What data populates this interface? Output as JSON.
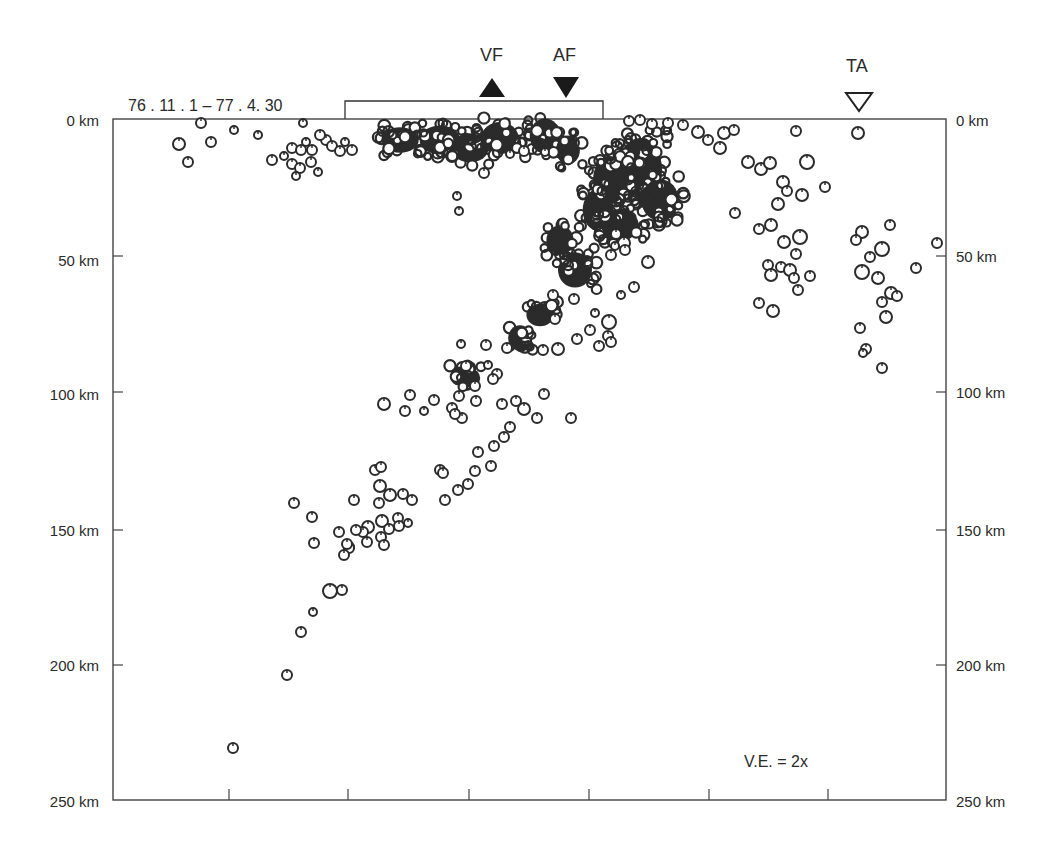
{
  "chart_data": {
    "type": "scatter",
    "title": "",
    "date_range_label": "76 . 11 . 1 – 77 . 4. 30",
    "annotation": "V.E. = 2x",
    "xlabel": "",
    "ylabel": "Depth",
    "ylim": [
      0,
      250
    ],
    "y_reversed": true,
    "xlim_km": [
      0,
      612
    ],
    "grid": false,
    "legend": null,
    "y_ticks": [
      {
        "value": 0,
        "label": "0 km"
      },
      {
        "value": 50,
        "label": "50 km"
      },
      {
        "value": 100,
        "label": "100 km"
      },
      {
        "value": 150,
        "label": "150 km"
      },
      {
        "value": 200,
        "label": "200 km"
      },
      {
        "value": 250,
        "label": "250 km"
      }
    ],
    "x_ticks_km": [
      85,
      172.5,
      261.5,
      349.5,
      437.5,
      525
    ],
    "markers": [
      {
        "label": "VF",
        "symbol": "filled-triangle-up",
        "x_km": 278.2
      },
      {
        "label": "AF",
        "symbol": "filled-triangle-down",
        "x_km": 332.6
      },
      {
        "label": "TA",
        "symbol": "open-triangle-down",
        "x_km": 547.7
      }
    ],
    "bracket_km": [
      170.4,
      359.8
    ],
    "series": [
      {
        "name": "hypocenters",
        "points_px": [
          [
            201,
            123,
            5
          ],
          [
            179,
            144,
            6
          ],
          [
            188,
            162,
            5
          ],
          [
            211,
            142,
            5
          ],
          [
            234,
            130,
            4
          ],
          [
            258,
            135,
            4
          ],
          [
            303,
            123,
            4
          ],
          [
            272,
            160,
            5
          ],
          [
            284,
            156,
            4
          ],
          [
            292,
            164,
            5
          ],
          [
            300,
            168,
            5
          ],
          [
            292,
            148,
            5
          ],
          [
            301,
            150,
            5
          ],
          [
            296,
            176,
            4
          ],
          [
            318,
            172,
            4
          ],
          [
            326,
            140,
            5
          ],
          [
            332,
            146,
            5
          ],
          [
            340,
            151,
            5
          ],
          [
            352,
            150,
            5
          ],
          [
            320,
            135,
            5
          ],
          [
            345,
            142,
            4
          ],
          [
            311,
            162,
            5
          ],
          [
            312,
            150,
            5
          ],
          [
            306,
            142,
            4
          ],
          [
            457,
            196,
            4
          ],
          [
            459,
            211,
            4
          ],
          [
            484,
            173,
            5
          ],
          [
            510,
            154,
            4
          ],
          [
            524,
            151,
            5
          ],
          [
            545,
            152,
            4
          ],
          [
            629,
            121,
            5
          ],
          [
            640,
            120,
            5
          ],
          [
            652,
            124,
            5
          ],
          [
            668,
            123,
            5
          ],
          [
            683,
            125,
            5
          ],
          [
            698,
            132,
            6
          ],
          [
            708,
            140,
            5
          ],
          [
            720,
            148,
            6
          ],
          [
            724,
            133,
            6
          ],
          [
            734,
            130,
            5
          ],
          [
            748,
            162,
            6
          ],
          [
            761,
            169,
            6
          ],
          [
            770,
            163,
            6
          ],
          [
            783,
            182,
            6
          ],
          [
            796,
            131,
            5
          ],
          [
            858,
            133,
            6
          ],
          [
            807,
            162,
            7
          ],
          [
            778,
            204,
            6
          ],
          [
            787,
            191,
            5
          ],
          [
            802,
            195,
            6
          ],
          [
            825,
            187,
            5
          ],
          [
            735,
            213,
            5
          ],
          [
            759,
            229,
            5
          ],
          [
            771,
            225,
            6
          ],
          [
            784,
            242,
            6
          ],
          [
            800,
            237,
            7
          ],
          [
            796,
            254,
            5
          ],
          [
            768,
            265,
            5
          ],
          [
            781,
            267,
            5
          ],
          [
            771,
            275,
            6
          ],
          [
            790,
            270,
            6
          ],
          [
            794,
            278,
            5
          ],
          [
            798,
            290,
            5
          ],
          [
            759,
            303,
            5
          ],
          [
            773,
            311,
            6
          ],
          [
            810,
            276,
            5
          ],
          [
            862,
            232,
            6
          ],
          [
            856,
            240,
            5
          ],
          [
            882,
            249,
            7
          ],
          [
            890,
            225,
            5
          ],
          [
            870,
            257,
            5
          ],
          [
            862,
            272,
            7
          ],
          [
            878,
            278,
            6
          ],
          [
            891,
            293,
            6
          ],
          [
            882,
            302,
            5
          ],
          [
            916,
            268,
            5
          ],
          [
            897,
            296,
            5
          ],
          [
            886,
            317,
            6
          ],
          [
            860,
            328,
            5
          ],
          [
            866,
            349,
            5
          ],
          [
            863,
            353,
            4
          ],
          [
            882,
            368,
            5
          ],
          [
            937,
            243,
            5
          ],
          [
            648,
            262,
            6
          ],
          [
            624,
            243,
            6
          ],
          [
            616,
            234,
            5
          ],
          [
            615,
            246,
            4
          ],
          [
            611,
            255,
            5
          ],
          [
            625,
            250,
            5
          ],
          [
            634,
            287,
            5
          ],
          [
            621,
            295,
            4
          ],
          [
            609,
            322,
            7
          ],
          [
            555,
            319,
            5
          ],
          [
            553,
            295,
            5
          ],
          [
            574,
            299,
            5
          ],
          [
            595,
            313,
            4
          ],
          [
            590,
            330,
            5
          ],
          [
            577,
            339,
            5
          ],
          [
            608,
            336,
            5
          ],
          [
            611,
            342,
            5
          ],
          [
            599,
            346,
            5
          ],
          [
            558,
            349,
            6
          ],
          [
            543,
            350,
            5
          ],
          [
            507,
            348,
            5
          ],
          [
            486,
            345,
            5
          ],
          [
            488,
            365,
            4
          ],
          [
            497,
            374,
            5
          ],
          [
            461,
            344,
            4
          ],
          [
            466,
            366,
            5
          ],
          [
            475,
            386,
            5
          ],
          [
            459,
            396,
            5
          ],
          [
            452,
            408,
            5
          ],
          [
            476,
            401,
            5
          ],
          [
            462,
            418,
            5
          ],
          [
            434,
            400,
            5
          ],
          [
            410,
            395,
            5
          ],
          [
            424,
            411,
            4
          ],
          [
            405,
            411,
            5
          ],
          [
            384,
            404,
            6
          ],
          [
            455,
            414,
            5
          ],
          [
            493,
            379,
            5
          ],
          [
            571,
            418,
            5
          ],
          [
            502,
            404,
            5
          ],
          [
            516,
            401,
            5
          ],
          [
            544,
            394,
            5
          ],
          [
            524,
            409,
            6
          ],
          [
            537,
            418,
            5
          ],
          [
            510,
            427,
            5
          ],
          [
            504,
            437,
            5
          ],
          [
            494,
            446,
            5
          ],
          [
            478,
            452,
            5
          ],
          [
            491,
            466,
            5
          ],
          [
            475,
            471,
            5
          ],
          [
            468,
            484,
            5
          ],
          [
            458,
            490,
            5
          ],
          [
            445,
            500,
            5
          ],
          [
            440,
            470,
            5
          ],
          [
            412,
            500,
            5
          ],
          [
            403,
            494,
            5
          ],
          [
            390,
            495,
            6
          ],
          [
            379,
            503,
            5
          ],
          [
            382,
            521,
            6
          ],
          [
            389,
            529,
            5
          ],
          [
            398,
            518,
            5
          ],
          [
            381,
            537,
            5
          ],
          [
            384,
            545,
            5
          ],
          [
            368,
            527,
            6
          ],
          [
            363,
            532,
            5
          ],
          [
            356,
            530,
            5
          ],
          [
            349,
            547,
            5
          ],
          [
            367,
            542,
            5
          ],
          [
            399,
            526,
            5
          ],
          [
            408,
            523,
            4
          ],
          [
            443,
            473,
            5
          ],
          [
            375,
            470,
            5
          ],
          [
            380,
            486,
            6
          ],
          [
            381,
            467,
            5
          ],
          [
            354,
            500,
            5
          ],
          [
            312,
            517,
            5
          ],
          [
            314,
            543,
            5
          ],
          [
            339,
            532,
            5
          ],
          [
            349,
            548,
            5
          ],
          [
            347,
            544,
            5
          ],
          [
            344,
            555,
            5
          ],
          [
            330,
            591,
            7
          ],
          [
            342,
            590,
            5
          ],
          [
            313,
            612,
            4
          ],
          [
            301,
            632,
            5
          ],
          [
            287,
            675,
            5
          ],
          [
            233,
            748,
            5
          ],
          [
            294,
            503,
            5
          ]
        ],
        "dense_clusters_px": [
          [
            400,
            140,
            22,
            16
          ],
          [
            440,
            140,
            24,
            18
          ],
          [
            470,
            148,
            22,
            18
          ],
          [
            500,
            138,
            22,
            20
          ],
          [
            545,
            136,
            18,
            22
          ],
          [
            568,
            150,
            14,
            18
          ],
          [
            640,
            170,
            26,
            40
          ],
          [
            660,
            200,
            22,
            26
          ],
          [
            610,
            180,
            20,
            30
          ],
          [
            598,
            210,
            18,
            26
          ],
          [
            620,
            225,
            22,
            20
          ],
          [
            575,
            270,
            20,
            22
          ],
          [
            560,
            240,
            16,
            18
          ],
          [
            540,
            315,
            16,
            14
          ],
          [
            520,
            338,
            14,
            16
          ],
          [
            470,
            378,
            12,
            12
          ],
          [
            459,
            376,
            10,
            12
          ]
        ]
      }
    ]
  }
}
